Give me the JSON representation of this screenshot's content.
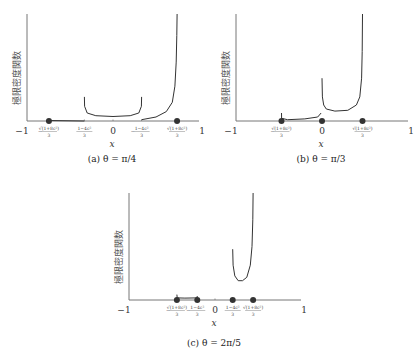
{
  "chart_data": [
    {
      "type": "line",
      "id": "a",
      "caption": "(a) θ = π/4",
      "xlabel": "x",
      "ylabel": "極限密度関数",
      "xlim": [
        -1,
        1
      ],
      "ylim": [
        0,
        4
      ],
      "theta": "π/4",
      "cos_sq": 0.5,
      "ticks": [
        {
          "x": -1,
          "label": "−1",
          "type": "plain"
        },
        {
          "x": -0.745,
          "label": "√(1+8c²)",
          "denom": "3",
          "neg": true,
          "type": "frac"
        },
        {
          "x": -0.333,
          "label": "1−4c²",
          "denom": "3",
          "neg": false,
          "type": "frac"
        },
        {
          "x": 0,
          "label": "0",
          "type": "plain"
        },
        {
          "x": 0.333,
          "label": "1−4c²",
          "denom": "3",
          "neg": true,
          "type": "frac"
        },
        {
          "x": 0.745,
          "label": "√(1+8c²)",
          "denom": "3",
          "neg": false,
          "type": "frac"
        },
        {
          "x": 1,
          "label": "1",
          "type": "plain"
        }
      ],
      "dots": [
        -0.745,
        0.745
      ],
      "segments": [
        {
          "name": "left-flat",
          "points": [
            [
              -0.745,
              0.02
            ],
            [
              -0.333,
              0.0
            ]
          ]
        },
        {
          "name": "middle-u",
          "points": [
            [
              -0.333,
              0.9
            ],
            [
              -0.33,
              0.55
            ],
            [
              -0.3,
              0.3
            ],
            [
              -0.2,
              0.2
            ],
            [
              0,
              0.17
            ],
            [
              0.2,
              0.2
            ],
            [
              0.3,
              0.3
            ],
            [
              0.33,
              0.55
            ],
            [
              0.333,
              0.9
            ]
          ]
        },
        {
          "name": "right-rise",
          "points": [
            [
              0.333,
              0.05
            ],
            [
              0.5,
              0.15
            ],
            [
              0.62,
              0.35
            ],
            [
              0.69,
              0.7
            ],
            [
              0.72,
              1.3
            ],
            [
              0.735,
              2.2
            ],
            [
              0.742,
              3.2
            ],
            [
              0.745,
              4.0
            ]
          ]
        }
      ]
    },
    {
      "type": "line",
      "id": "b",
      "caption": "(b) θ = π/3",
      "xlabel": "x",
      "ylabel": "極限密度関数",
      "xlim": [
        -1,
        1
      ],
      "ylim": [
        0,
        4
      ],
      "theta": "π/3",
      "cos_sq": 0.25,
      "ticks": [
        {
          "x": -1,
          "label": "−1",
          "type": "plain"
        },
        {
          "x": -0.471,
          "label": "√(1+8c²)",
          "denom": "3",
          "neg": true,
          "type": "frac"
        },
        {
          "x": 0,
          "label": "0",
          "type": "plain"
        },
        {
          "x": 0.471,
          "label": "√(1+8c²)",
          "denom": "3",
          "neg": false,
          "type": "frac"
        },
        {
          "x": 1,
          "label": "1",
          "type": "plain"
        }
      ],
      "dots": [
        -0.471,
        0,
        0.471
      ],
      "segments": [
        {
          "name": "left-flat",
          "points": [
            [
              -0.471,
              0.3
            ],
            [
              -0.47,
              0.1
            ],
            [
              -0.4,
              0.05
            ],
            [
              -0.2,
              0.08
            ],
            [
              -0.05,
              0.15
            ],
            [
              -0.01,
              0.3
            ]
          ]
        },
        {
          "name": "right-u",
          "points": [
            [
              0.0,
              1.6
            ],
            [
              0.005,
              0.9
            ],
            [
              0.02,
              0.6
            ],
            [
              0.05,
              0.45
            ],
            [
              0.15,
              0.37
            ],
            [
              0.3,
              0.4
            ],
            [
              0.4,
              0.6
            ],
            [
              0.44,
              0.9
            ],
            [
              0.46,
              1.6
            ],
            [
              0.468,
              2.6
            ],
            [
              0.471,
              4.0
            ]
          ]
        }
      ]
    },
    {
      "type": "line",
      "id": "c",
      "caption": "(c) θ = 2π/5",
      "xlabel": "x",
      "ylabel": "極限密度関数",
      "xlim": [
        -1,
        1
      ],
      "ylim": [
        0,
        4
      ],
      "theta": "2π/5",
      "cos_sq": 0.0955,
      "ticks": [
        {
          "x": -1,
          "label": "−1",
          "type": "plain"
        },
        {
          "x": -0.443,
          "label": "√(1+8c²)",
          "denom": "3",
          "neg": true,
          "type": "frac"
        },
        {
          "x": -0.206,
          "label": "1−4c²",
          "denom": "3",
          "neg": true,
          "type": "frac"
        },
        {
          "x": 0,
          "label": "0",
          "type": "plain"
        },
        {
          "x": 0.206,
          "label": "1−4c²",
          "denom": "3",
          "neg": false,
          "type": "frac"
        },
        {
          "x": 0.443,
          "label": "√(1+8c²)",
          "denom": "3",
          "neg": false,
          "type": "frac"
        },
        {
          "x": 1,
          "label": "1",
          "type": "plain"
        }
      ],
      "dots": [
        -0.443,
        -0.206,
        0.206,
        0.443
      ],
      "segments": [
        {
          "name": "left-flat",
          "points": [
            [
              -0.443,
              0.2
            ],
            [
              -0.44,
              0.08
            ],
            [
              -0.35,
              0.07
            ],
            [
              -0.21,
              0.08
            ],
            [
              -0.206,
              0.15
            ]
          ]
        },
        {
          "name": "right-u",
          "points": [
            [
              0.206,
              1.9
            ],
            [
              0.21,
              1.3
            ],
            [
              0.23,
              0.9
            ],
            [
              0.27,
              0.72
            ],
            [
              0.32,
              0.72
            ],
            [
              0.37,
              0.85
            ],
            [
              0.41,
              1.3
            ],
            [
              0.43,
              2.0
            ],
            [
              0.44,
              3.0
            ],
            [
              0.443,
              4.0
            ]
          ]
        }
      ]
    }
  ]
}
